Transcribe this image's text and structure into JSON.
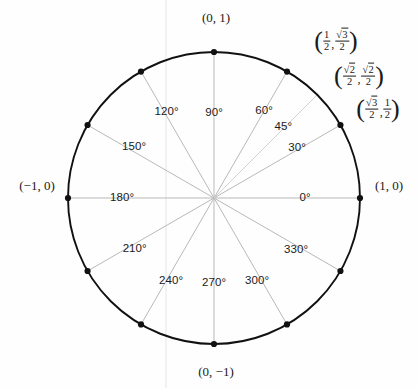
{
  "diagram": {
    "geometry": {
      "center_x": 214,
      "center_y": 198,
      "radius": 146,
      "circle_color": "#111111",
      "spoke_color": "#b9b9b9",
      "dot_color": "#111111",
      "dot_radius": 3.1,
      "artifact_line_x": 166,
      "artifact_color": "#ededed"
    },
    "angles": [
      {
        "label": "0°",
        "degrees": 0,
        "label_r": 91,
        "dx": 0,
        "dy": 0
      },
      {
        "label": "30°",
        "degrees": 30,
        "label_r": 96,
        "dx": 0,
        "dy": -2
      },
      {
        "label": "45°",
        "degrees": 45,
        "label_r": 101,
        "dx": -2,
        "dy": 0
      },
      {
        "label": "60°",
        "degrees": 60,
        "label_r": 104,
        "dx": -2,
        "dy": 3
      },
      {
        "label": "90°",
        "degrees": 90,
        "label_r": 85,
        "dx": 0,
        "dy": 0
      },
      {
        "label": "120°",
        "degrees": 120,
        "label_r": 103,
        "dx": 4,
        "dy": 3
      },
      {
        "label": "150°",
        "degrees": 150,
        "label_r": 97,
        "dx": 4,
        "dy": -3
      },
      {
        "label": "180°",
        "degrees": 180,
        "label_r": 92,
        "dx": 0,
        "dy": 0
      },
      {
        "label": "210°",
        "degrees": 210,
        "label_r": 95,
        "dx": 3,
        "dy": 3
      },
      {
        "label": "240°",
        "degrees": 240,
        "label_r": 98,
        "dx": 6,
        "dy": -2
      },
      {
        "label": "270°",
        "degrees": 270,
        "label_r": 85,
        "dx": 0,
        "dy": 0
      },
      {
        "label": "300°",
        "degrees": 300,
        "label_r": 98,
        "dx": -6,
        "dy": -2
      },
      {
        "label": "330°",
        "degrees": 330,
        "label_r": 97,
        "dx": -2,
        "dy": 3
      }
    ],
    "axis_coords": [
      {
        "name": "top",
        "text": "(0, 1)",
        "x": 216,
        "y": 17
      },
      {
        "name": "left",
        "text": "(−1, 0)",
        "x": 37,
        "y": 185
      },
      {
        "name": "right",
        "text": "(1, 0)",
        "x": 389,
        "y": 185
      },
      {
        "name": "bottom",
        "text": "(0, −1)",
        "x": 216,
        "y": 371
      }
    ],
    "fraction_coords": [
      {
        "name": "coord-60",
        "x": 336,
        "y": 41,
        "nx": "1",
        "dx_": "2",
        "nx_rad": false,
        "ny": "3",
        "dy_": "2",
        "ny_rad": true
      },
      {
        "name": "coord-45",
        "x": 359,
        "y": 76,
        "nx": "2",
        "dx_": "2",
        "nx_rad": true,
        "ny": "2",
        "dy_": "2",
        "ny_rad": true
      },
      {
        "name": "coord-30",
        "x": 378,
        "y": 109,
        "nx": "3",
        "dx_": "2",
        "nx_rad": true,
        "ny": "1",
        "dy_": "2",
        "ny_rad": false
      }
    ],
    "dots_degrees": [
      0,
      30,
      60,
      90,
      120,
      150,
      180,
      210,
      240,
      270,
      300,
      330
    ]
  }
}
